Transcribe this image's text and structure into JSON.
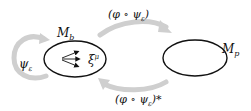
{
  "diagram": {
    "nodes": [
      {
        "id": "Mb",
        "label": "M_b",
        "label_main": "M",
        "label_sub": "b",
        "shape": "ellipse"
      },
      {
        "id": "Mp",
        "label": "M_p",
        "label_main": "M",
        "label_sub": "p",
        "shape": "ellipse"
      }
    ],
    "vector_field": {
      "label": "ξ^μ",
      "label_main": "ξ",
      "label_sup": "μ",
      "arrow_count": 3
    },
    "arrows": [
      {
        "from": "Mb",
        "to": "Mb",
        "label": "ψ_ε",
        "label_main": "ψ",
        "label_sub": "ε",
        "type": "self-loop"
      },
      {
        "from": "Mb",
        "to": "Mp",
        "label": "(φ ∘ ψ_ε)",
        "label_pre": "(φ ∘ ψ",
        "label_sub": "ε",
        "label_post": ")"
      },
      {
        "from": "Mp",
        "to": "Mb",
        "label": "(φ ∘ ψ_ε)*",
        "label_pre": "(φ ∘ ψ",
        "label_sub": "ε",
        "label_post": ")*"
      }
    ],
    "colors": {
      "ellipse_stroke": "#111111",
      "arrow_gray": "#c8c8c8",
      "text": "#111111"
    }
  }
}
